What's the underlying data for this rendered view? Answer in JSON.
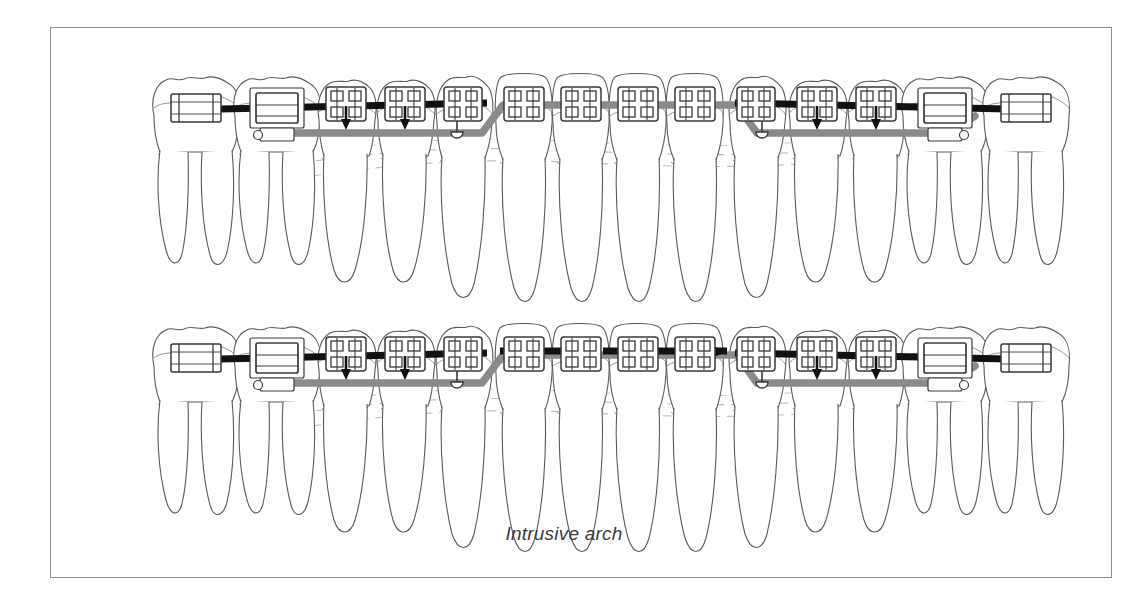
{
  "figure": {
    "caption": "Intrusive arch",
    "frame": {
      "border_color": "#8d9092",
      "background": "#ffffff"
    }
  },
  "colors": {
    "tooth_outline": "#5a5a5a",
    "tooth_inner": "#7d7d7d",
    "bracket_outline": "#3a3a3a",
    "bracket_fill": "#ffffff",
    "archwire_black": "#111111",
    "intrusive_arch_gray": "#8a8a8a",
    "gingival_dash": "#c9b6b6",
    "caption_text": "#3c3c3c"
  },
  "arches": [
    {
      "id": "upper-arch",
      "name": "Upper arch — intrusive arch not engaged anteriorly",
      "anterior_segment_wire_engaged": false,
      "baseline_y": 105,
      "teeth": [
        {
          "position": 1,
          "label": "second-molar-left",
          "type": "molar",
          "roots": 2,
          "appliance": "buccal-tube",
          "force_arrow": false
        },
        {
          "position": 2,
          "label": "first-molar-left",
          "type": "molar",
          "roots": 2,
          "appliance": "molar-tube-with-hook",
          "force_arrow": false
        },
        {
          "position": 3,
          "label": "second-premolar-left",
          "type": "premolar",
          "roots": 1,
          "appliance": "bracket",
          "force_arrow": true
        },
        {
          "position": 4,
          "label": "first-premolar-left",
          "type": "premolar",
          "roots": 1,
          "appliance": "bracket",
          "force_arrow": true
        },
        {
          "position": 5,
          "label": "canine-left",
          "type": "canine",
          "roots": 1,
          "appliance": "bracket-with-hook",
          "force_arrow": false
        },
        {
          "position": 6,
          "label": "lateral-incisor-left",
          "type": "incisor",
          "roots": 1,
          "appliance": "bracket",
          "force_arrow": false
        },
        {
          "position": 7,
          "label": "central-incisor-left",
          "type": "incisor",
          "roots": 1,
          "appliance": "bracket",
          "force_arrow": false
        },
        {
          "position": 8,
          "label": "central-incisor-right",
          "type": "incisor",
          "roots": 1,
          "appliance": "bracket",
          "force_arrow": false
        },
        {
          "position": 9,
          "label": "lateral-incisor-right",
          "type": "incisor",
          "roots": 1,
          "appliance": "bracket",
          "force_arrow": false
        },
        {
          "position": 10,
          "label": "canine-right",
          "type": "canine",
          "roots": 1,
          "appliance": "bracket-with-hook",
          "force_arrow": false
        },
        {
          "position": 11,
          "label": "first-premolar-right",
          "type": "premolar",
          "roots": 1,
          "appliance": "bracket",
          "force_arrow": true
        },
        {
          "position": 12,
          "label": "second-premolar-right",
          "type": "premolar",
          "roots": 1,
          "appliance": "bracket",
          "force_arrow": true
        },
        {
          "position": 13,
          "label": "first-molar-right",
          "type": "molar",
          "roots": 2,
          "appliance": "molar-tube-with-hook",
          "force_arrow": false
        },
        {
          "position": 14,
          "label": "second-molar-right",
          "type": "molar",
          "roots": 2,
          "appliance": "buccal-tube",
          "force_arrow": false
        }
      ]
    },
    {
      "id": "lower-arch",
      "name": "Lower arch — anterior segment wire engaged",
      "anterior_segment_wire_engaged": true,
      "baseline_y": 355,
      "teeth": [
        {
          "position": 1,
          "label": "second-molar-left",
          "type": "molar",
          "roots": 2,
          "appliance": "buccal-tube",
          "force_arrow": false
        },
        {
          "position": 2,
          "label": "first-molar-left",
          "type": "molar",
          "roots": 2,
          "appliance": "molar-tube-with-hook",
          "force_arrow": false
        },
        {
          "position": 3,
          "label": "second-premolar-left",
          "type": "premolar",
          "roots": 1,
          "appliance": "bracket",
          "force_arrow": true
        },
        {
          "position": 4,
          "label": "first-premolar-left",
          "type": "premolar",
          "roots": 1,
          "appliance": "bracket",
          "force_arrow": true
        },
        {
          "position": 5,
          "label": "canine-left",
          "type": "canine",
          "roots": 1,
          "appliance": "bracket-with-hook",
          "force_arrow": false
        },
        {
          "position": 6,
          "label": "lateral-incisor-left",
          "type": "incisor",
          "roots": 1,
          "appliance": "bracket",
          "force_arrow": false
        },
        {
          "position": 7,
          "label": "central-incisor-left",
          "type": "incisor",
          "roots": 1,
          "appliance": "bracket",
          "force_arrow": false
        },
        {
          "position": 8,
          "label": "central-incisor-right",
          "type": "incisor",
          "roots": 1,
          "appliance": "bracket",
          "force_arrow": false
        },
        {
          "position": 9,
          "label": "lateral-incisor-right",
          "type": "incisor",
          "roots": 1,
          "appliance": "bracket",
          "force_arrow": false
        },
        {
          "position": 10,
          "label": "canine-right",
          "type": "canine",
          "roots": 1,
          "appliance": "bracket-with-hook",
          "force_arrow": false
        },
        {
          "position": 11,
          "label": "first-premolar-right",
          "type": "premolar",
          "roots": 1,
          "appliance": "bracket",
          "force_arrow": true
        },
        {
          "position": 12,
          "label": "second-premolar-right",
          "type": "premolar",
          "roots": 1,
          "appliance": "bracket",
          "force_arrow": true
        },
        {
          "position": 13,
          "label": "first-molar-right",
          "type": "molar",
          "roots": 2,
          "appliance": "molar-tube-with-hook",
          "force_arrow": false
        },
        {
          "position": 14,
          "label": "second-molar-right",
          "type": "molar",
          "roots": 2,
          "appliance": "buccal-tube",
          "force_arrow": false
        }
      ]
    }
  ]
}
